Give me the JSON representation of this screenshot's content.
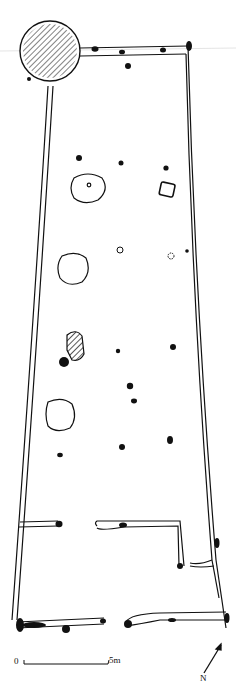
{
  "figure": {
    "type": "archaeological site plan",
    "scale_bar": {
      "start_label": "0",
      "end_label": "5m"
    },
    "north_arrow": {
      "label": "N"
    },
    "features": {
      "large_hatched_circle": 1,
      "outlined_pits": 4,
      "hatched_feature": 1,
      "square_feature": 1,
      "postholes": 16,
      "small_open_rings": 2
    }
  },
  "colors": {
    "ink": "#111111",
    "background": "#ffffff"
  }
}
